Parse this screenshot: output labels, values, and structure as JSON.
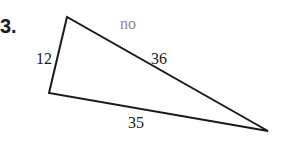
{
  "problem": {
    "number": "3.",
    "answer_note": "no",
    "colors": {
      "line": "#1a1a1a",
      "note": "#8a8a8a"
    },
    "triangle": {
      "vertices": {
        "top": [
          67,
          17
        ],
        "bottom_left": [
          49,
          93
        ],
        "right": [
          268,
          131
        ]
      },
      "sides": [
        {
          "name": "left",
          "length": "12"
        },
        {
          "name": "top",
          "length": "36"
        },
        {
          "name": "bottom",
          "length": "35"
        }
      ]
    }
  }
}
